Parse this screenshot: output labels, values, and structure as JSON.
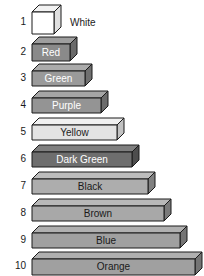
{
  "chart_data": {
    "type": "bar",
    "xlabel": "",
    "ylabel": "",
    "orientation": "horizontal",
    "grid": false,
    "legend": "none",
    "categories": [
      "1",
      "2",
      "3",
      "4",
      "5",
      "6",
      "7",
      "8",
      "9",
      "10"
    ],
    "values": [
      1,
      2,
      3,
      4,
      5,
      6,
      7,
      8,
      9,
      10
    ],
    "tick_labels": [
      "1",
      "2",
      "3",
      "4",
      "5",
      "6",
      "7",
      "8",
      "9",
      "10"
    ],
    "data_labels": [
      "White",
      "Red",
      "Green",
      "Purple",
      "Yellow",
      "Dark Green",
      "Black",
      "Brown",
      "Blue",
      "Orange"
    ],
    "xlim": [
      0,
      10
    ],
    "unit": "rod units"
  },
  "rods": [
    {
      "number": "1",
      "label": "White",
      "units": 1,
      "face_color": "#ffffff",
      "top_color": "#f2f2f2",
      "side_color": "#e0e0e0",
      "edge_color": "#1a1a1a",
      "text_color": "#222222",
      "label_inside": false,
      "body_w": 22,
      "body_h": 22
    },
    {
      "number": "2",
      "label": "Red",
      "units": 2,
      "face_color": "#8a8a8a",
      "top_color": "#9e9e9e",
      "side_color": "#6a6a6a",
      "edge_color": "#1a1a1a",
      "text_color": "#ffffff",
      "label_inside": true,
      "body_w": 38,
      "body_h": 17
    },
    {
      "number": "3",
      "label": "Green",
      "units": 3,
      "face_color": "#9a9a9a",
      "top_color": "#ababab",
      "side_color": "#6f6f6f",
      "edge_color": "#1a1a1a",
      "text_color": "#ffffff",
      "label_inside": true,
      "body_w": 53,
      "body_h": 15
    },
    {
      "number": "4",
      "label": "Purple",
      "units": 4,
      "face_color": "#949494",
      "top_color": "#a5a5a5",
      "side_color": "#6b6b6b",
      "edge_color": "#1a1a1a",
      "text_color": "#ffffff",
      "label_inside": true,
      "body_w": 69,
      "body_h": 15
    },
    {
      "number": "5",
      "label": "Yellow",
      "units": 5,
      "face_color": "#e3e3e3",
      "top_color": "#f0f0f0",
      "side_color": "#c2c2c2",
      "edge_color": "#1a1a1a",
      "text_color": "#222222",
      "label_inside": true,
      "body_w": 85,
      "body_h": 15
    },
    {
      "number": "6",
      "label": "Dark Green",
      "units": 6,
      "face_color": "#6e6e6e",
      "top_color": "#7f7f7f",
      "side_color": "#4d4d4d",
      "edge_color": "#1a1a1a",
      "text_color": "#ffffff",
      "label_inside": true,
      "body_w": 100,
      "body_h": 15
    },
    {
      "number": "7",
      "label": "Black",
      "units": 7,
      "face_color": "#adadad",
      "top_color": "#bdbdbd",
      "side_color": "#808080",
      "edge_color": "#1a1a1a",
      "text_color": "#1a1a1a",
      "label_inside": true,
      "body_w": 116,
      "body_h": 15
    },
    {
      "number": "8",
      "label": "Brown",
      "units": 8,
      "face_color": "#a8a8a8",
      "top_color": "#b8b8b8",
      "side_color": "#7a7a7a",
      "edge_color": "#1a1a1a",
      "text_color": "#1a1a1a",
      "label_inside": true,
      "body_w": 132,
      "body_h": 15
    },
    {
      "number": "9",
      "label": "Blue",
      "units": 9,
      "face_color": "#a0a0a0",
      "top_color": "#b0b0b0",
      "side_color": "#747474",
      "edge_color": "#1a1a1a",
      "text_color": "#1a1a1a",
      "label_inside": true,
      "body_w": 148,
      "body_h": 15
    },
    {
      "number": "10",
      "label": "Orange",
      "units": 10,
      "face_color": "#a0a0a0",
      "top_color": "#b0b0b0",
      "side_color": "#747474",
      "edge_color": "#1a1a1a",
      "text_color": "#1a1a1a",
      "label_inside": true,
      "body_w": 163,
      "body_h": 16
    }
  ]
}
